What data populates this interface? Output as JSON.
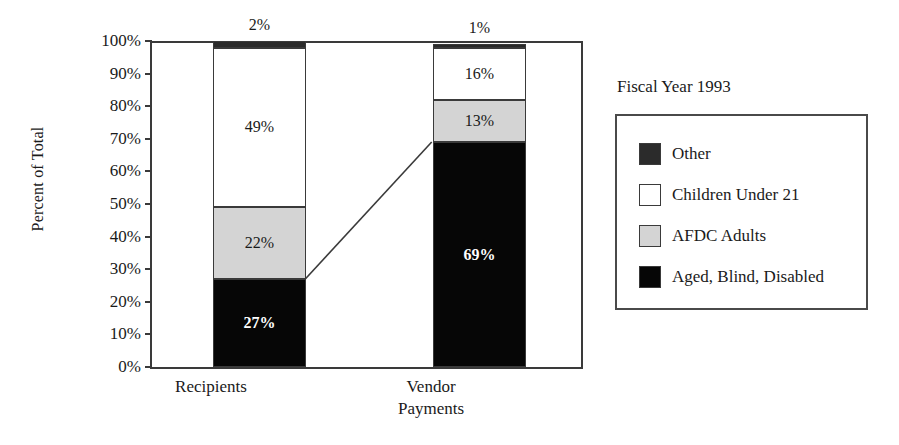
{
  "chart_data": {
    "type": "bar",
    "subtype": "100% stacked bar",
    "title": "",
    "legend_title": "Fiscal Year 1993",
    "legend_position": "right",
    "grid": false,
    "xlabel": "",
    "ylabel": "Percent of Total",
    "ylim": [
      0,
      100
    ],
    "ytick_labels": [
      "100%",
      "90%",
      "80%",
      "70%",
      "60%",
      "50%",
      "40%",
      "30%",
      "20%",
      "10%",
      "0%"
    ],
    "ytick_values": [
      100,
      90,
      80,
      70,
      60,
      50,
      40,
      30,
      20,
      10,
      0
    ],
    "categories": [
      "Recipients",
      "Vendor Payments"
    ],
    "series": [
      {
        "name": "Other",
        "color": "#2b2b2b",
        "values": [
          2,
          1
        ],
        "labels": [
          "2%",
          "1%"
        ]
      },
      {
        "name": "Children Under 21",
        "color": "#ffffff",
        "values": [
          49,
          16
        ],
        "labels": [
          "49%",
          "16%"
        ]
      },
      {
        "name": "AFDC Adults",
        "color": "#d4d4d4",
        "values": [
          22,
          13
        ],
        "labels": [
          "22%",
          "13%"
        ]
      },
      {
        "name": "Aged, Blind, Disabled",
        "color": "#060606",
        "values": [
          27,
          69
        ],
        "labels": [
          "27%",
          "69%"
        ]
      }
    ],
    "annotations": [
      {
        "type": "connector-line",
        "description": "line joining top of Aged, Blind, Disabled segment across the two bars",
        "from": {
          "category": "Recipients",
          "value": 27
        },
        "to": {
          "category": "Vendor Payments",
          "value": 69
        }
      }
    ]
  },
  "axes": {
    "y_title": "Percent of Total",
    "y_ticks": [
      "100%",
      "90%",
      "80%",
      "70%",
      "60%",
      "50%",
      "40%",
      "30%",
      "20%",
      "10%",
      "0%"
    ],
    "x_categories": [
      {
        "line1": "Recipients",
        "line2": ""
      },
      {
        "line1": "Vendor",
        "line2": "Payments"
      }
    ]
  },
  "bars": [
    {
      "category": "Recipients",
      "segments": [
        {
          "key": "other",
          "label": "2%",
          "value": 2,
          "label_placement": "outside-top",
          "on_dark": false
        },
        {
          "key": "children",
          "label": "49%",
          "value": 49,
          "label_placement": "inside",
          "on_dark": false
        },
        {
          "key": "afdc",
          "label": "22%",
          "value": 22,
          "label_placement": "inside",
          "on_dark": false
        },
        {
          "key": "aged",
          "label": "27%",
          "value": 27,
          "label_placement": "inside",
          "on_dark": true
        }
      ]
    },
    {
      "category": "Vendor Payments",
      "segments": [
        {
          "key": "other",
          "label": "1%",
          "value": 1,
          "label_placement": "outside-top",
          "on_dark": false
        },
        {
          "key": "children",
          "label": "16%",
          "value": 16,
          "label_placement": "inside",
          "on_dark": false
        },
        {
          "key": "afdc",
          "label": "13%",
          "value": 13,
          "label_placement": "inside",
          "on_dark": false
        },
        {
          "key": "aged",
          "label": "69%",
          "value": 69,
          "label_placement": "inside",
          "on_dark": true
        }
      ]
    }
  ],
  "legend": {
    "title": "Fiscal Year 1993",
    "items": [
      {
        "label": "Other",
        "color": "#2b2b2b"
      },
      {
        "label": "Children Under 21",
        "color": "#ffffff"
      },
      {
        "label": "AFDC Adults",
        "color": "#d4d4d4"
      },
      {
        "label": "Aged, Blind, Disabled",
        "color": "#060606"
      }
    ]
  }
}
